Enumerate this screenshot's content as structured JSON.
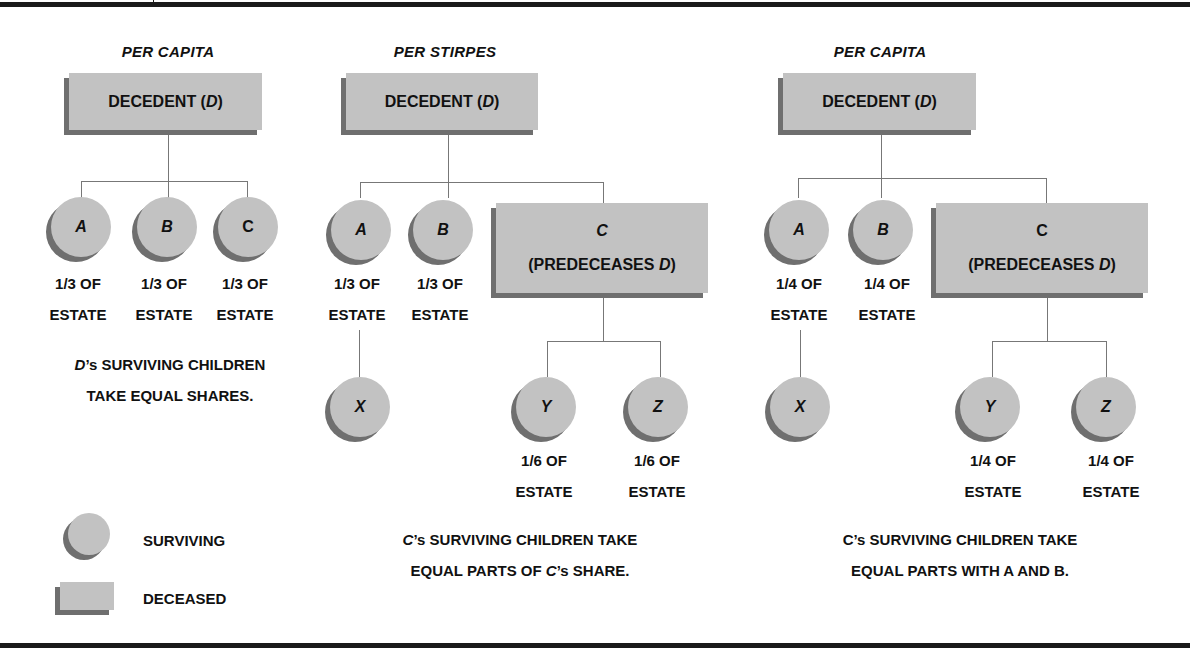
{
  "panels": [
    {
      "heading": "PER CAPITA",
      "decedent": {
        "label": "DECEDENT",
        "symbol": "D"
      },
      "children": [
        {
          "name": "A",
          "share_line1": "1/3 OF",
          "share_line2": "ESTATE",
          "status": "surviving"
        },
        {
          "name": "B",
          "share_line1": "1/3 OF",
          "share_line2": "ESTATE",
          "status": "surviving"
        },
        {
          "name": "C",
          "share_line1": "1/3 OF",
          "share_line2": "ESTATE",
          "status": "surviving"
        }
      ],
      "caption_line1_prefix": "D",
      "caption_line1_rest": "’s SURVIVING CHILDREN",
      "caption_line2": "TAKE EQUAL SHARES."
    },
    {
      "heading": "PER STIRPES",
      "decedent": {
        "label": "DECEDENT",
        "symbol": "D"
      },
      "children": [
        {
          "name": "A",
          "share_line1": "1/3 OF",
          "share_line2": "ESTATE",
          "status": "surviving"
        },
        {
          "name": "B",
          "share_line1": "1/3 OF",
          "share_line2": "ESTATE",
          "status": "surviving"
        },
        {
          "name": "C",
          "note": "(PREDECEASES",
          "note_symbol": "D",
          "note_close": ")",
          "status": "deceased"
        }
      ],
      "grandchildren": [
        {
          "name": "X",
          "parent": "A",
          "status": "surviving"
        },
        {
          "name": "Y",
          "parent": "C",
          "share_line1": "1/6 OF",
          "share_line2": "ESTATE",
          "status": "surviving"
        },
        {
          "name": "Z",
          "parent": "C",
          "share_line1": "1/6 OF",
          "share_line2": "ESTATE",
          "status": "surviving"
        }
      ],
      "caption_line1_prefix": "C",
      "caption_line1_rest": "’s SURVIVING CHILDREN TAKE",
      "caption_line2_a": "EQUAL PARTS OF ",
      "caption_line2_symbol": "C",
      "caption_line2_b": "’s SHARE."
    },
    {
      "heading": "PER CAPITA",
      "decedent": {
        "label": "DECEDENT",
        "symbol": "D"
      },
      "children": [
        {
          "name": "A",
          "share_line1": "1/4 OF",
          "share_line2": "ESTATE",
          "status": "surviving"
        },
        {
          "name": "B",
          "share_line1": "1/4 OF",
          "share_line2": "ESTATE",
          "status": "surviving"
        },
        {
          "name": "C",
          "note": "(PREDECEASES",
          "note_symbol": "D",
          "note_close": ")",
          "status": "deceased"
        }
      ],
      "grandchildren": [
        {
          "name": "X",
          "parent": "A",
          "status": "surviving"
        },
        {
          "name": "Y",
          "parent": "C",
          "share_line1": "1/4 OF",
          "share_line2": "ESTATE",
          "status": "surviving"
        },
        {
          "name": "Z",
          "parent": "C",
          "share_line1": "1/4 OF",
          "share_line2": "ESTATE",
          "status": "surviving"
        }
      ],
      "caption_line1": "C’s SURVIVING CHILDREN TAKE",
      "caption_line2": "EQUAL PARTS WITH A AND B."
    }
  ],
  "legend": {
    "surviving": "SURVIVING",
    "deceased": "DECEASED"
  },
  "colors": {
    "node_fill": "#c2c2c2",
    "node_shadow": "#6f6f6f",
    "connector": "#777777",
    "rule": "#1a1a1a"
  }
}
